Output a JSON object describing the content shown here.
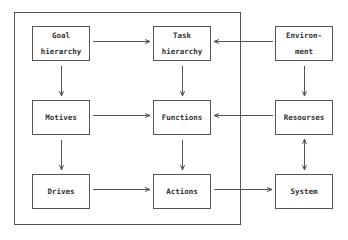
{
  "diagram": {
    "frame_label": "",
    "nodes": [
      {
        "id": "goal",
        "label": "Goal\nhierarchy"
      },
      {
        "id": "task",
        "label": "Task\nhierarchy"
      },
      {
        "id": "environment",
        "label": "Environ-\nment"
      },
      {
        "id": "motives",
        "label": "Motives"
      },
      {
        "id": "functions",
        "label": "Functions"
      },
      {
        "id": "resources",
        "label": "Resourses"
      },
      {
        "id": "drives",
        "label": "Drives"
      },
      {
        "id": "actions",
        "label": "Actions"
      },
      {
        "id": "system",
        "label": "System"
      }
    ],
    "edges": [
      {
        "from": "goal",
        "to": "task"
      },
      {
        "from": "environment",
        "to": "task"
      },
      {
        "from": "goal",
        "to": "motives"
      },
      {
        "from": "task",
        "to": "functions"
      },
      {
        "from": "environment",
        "to": "resources"
      },
      {
        "from": "motives",
        "to": "functions"
      },
      {
        "from": "resources",
        "to": "functions"
      },
      {
        "from": "motives",
        "to": "drives"
      },
      {
        "from": "functions",
        "to": "actions"
      },
      {
        "from": "resources",
        "to": "system",
        "bidirectional": true
      },
      {
        "from": "drives",
        "to": "actions"
      },
      {
        "from": "actions",
        "to": "system"
      }
    ],
    "colors": {
      "line": "#555555",
      "text": "#333333",
      "background": "#ffffff"
    }
  }
}
